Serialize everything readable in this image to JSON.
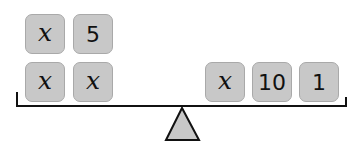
{
  "diagram": {
    "type": "balance-scale",
    "left_pan": {
      "rows": [
        [
          {
            "label": "x",
            "kind": "variable"
          },
          {
            "label": "5",
            "kind": "number"
          }
        ],
        [
          {
            "label": "x",
            "kind": "variable"
          },
          {
            "label": "x",
            "kind": "variable"
          }
        ]
      ]
    },
    "right_pan": {
      "rows": [
        [
          {
            "label": "x",
            "kind": "variable"
          },
          {
            "label": "10",
            "kind": "number"
          },
          {
            "label": "1",
            "kind": "number"
          }
        ]
      ]
    },
    "colors": {
      "tile_fill": "#c8c8c8",
      "tile_border": "#a9a9a9",
      "beam": "#111111",
      "fulcrum_fill": "#c8c8c8"
    }
  }
}
